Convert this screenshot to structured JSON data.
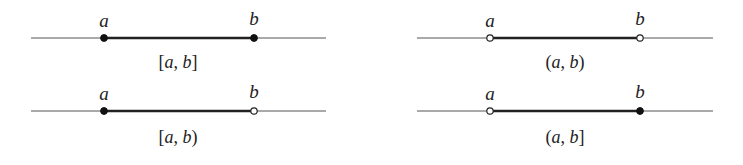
{
  "diagrams": [
    {
      "notation": "[a, b]",
      "left_bracket": "[",
      "right_bracket": "]",
      "a_label": "a",
      "b_label": "b",
      "a_closed": true,
      "b_closed": true
    },
    {
      "notation": "(a, b)",
      "left_bracket": "(",
      "right_bracket": ")",
      "a_label": "a",
      "b_label": "b",
      "a_closed": false,
      "b_closed": false
    },
    {
      "notation": "[a, b)",
      "left_bracket": "[",
      "right_bracket": ")",
      "a_label": "a",
      "b_label": "b",
      "a_closed": true,
      "b_closed": false
    },
    {
      "notation": "(a, b]",
      "left_bracket": "(",
      "right_bracket": "]",
      "a_label": "a",
      "b_label": "b",
      "a_closed": false,
      "b_closed": true
    }
  ],
  "separator": ", ",
  "colors": {
    "line": "#555555",
    "segment": "#222222",
    "point": "#111111",
    "background": "#ffffff"
  }
}
